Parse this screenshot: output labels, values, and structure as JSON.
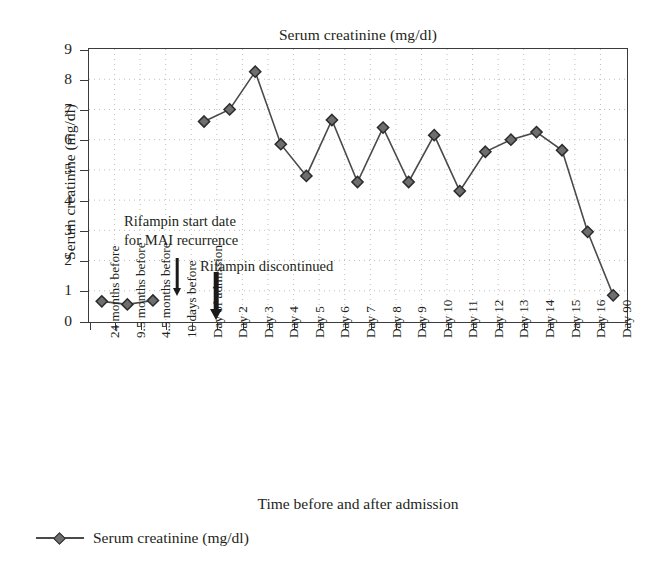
{
  "chart_data": {
    "type": "line",
    "title": "Serum creatinine (mg/dl)",
    "xlabel": "Time before and after admission",
    "ylabel": "Serum creatinine (mg/dl)",
    "ylim": [
      0,
      9
    ],
    "ytick_values": [
      0,
      1,
      2,
      3,
      4,
      5,
      6,
      7,
      8,
      9
    ],
    "ytick_labels": [
      "0",
      "1",
      "2",
      "3",
      "4",
      "5",
      "6",
      "7",
      "8",
      "9"
    ],
    "grid": "dotted-both-axes",
    "legend_position": "below-plot-left",
    "legend": [
      {
        "name": "Serum creatinine (mg/dl)",
        "marker": "diamond",
        "color": "#6e6e6e"
      }
    ],
    "categories": [
      "24 months before",
      "9.5 months before",
      "4.5 months before",
      "10 days before",
      "Day of admission",
      "Day 2",
      "Day 3",
      "Day 4",
      "Day 5",
      "Day 6",
      "Day 7",
      "Day 8",
      "Day 9",
      "Day 10",
      "Day 11",
      "Day 12",
      "Day 13",
      "Day 14",
      "Day 15",
      "Day 16",
      "Day 90"
    ],
    "series": [
      {
        "name": "Serum creatinine (mg/dl)",
        "values": [
          0.65,
          0.55,
          0.68,
          null,
          6.6,
          7.0,
          8.25,
          5.85,
          4.8,
          6.65,
          4.6,
          6.4,
          4.6,
          6.15,
          4.3,
          5.6,
          6.0,
          6.25,
          5.65,
          2.95,
          0.85
        ]
      }
    ],
    "annotations": [
      {
        "id": "rifampin-start",
        "text_line1": "Rifampin start date",
        "text_line2": "for MAI recurrence",
        "arrow": "down-thin",
        "points_to_category": "10 days before"
      },
      {
        "id": "rifampin-discontinued",
        "text_line1": "Rifampin discontinued",
        "arrow": "down-thick",
        "points_to_category": "Day of admission"
      }
    ]
  }
}
